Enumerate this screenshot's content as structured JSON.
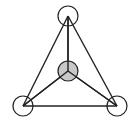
{
  "diagram": {
    "type": "tetrahedral-graph",
    "stroke_color": "#222222",
    "center_fill": "#c8c8c8",
    "outer_fill": "#ffffff",
    "nodes": [
      {
        "id": "top",
        "x": 68,
        "y": 16,
        "r": 10,
        "filled": false
      },
      {
        "id": "bottom-left",
        "x": 23,
        "y": 106,
        "r": 10,
        "filled": false
      },
      {
        "id": "bottom-right",
        "x": 117,
        "y": 106,
        "r": 10,
        "filled": false
      },
      {
        "id": "center",
        "x": 68,
        "y": 71,
        "r": 10,
        "filled": true
      }
    ],
    "edges": [
      [
        "top",
        "bottom-left"
      ],
      [
        "top",
        "bottom-right"
      ],
      [
        "bottom-left",
        "bottom-right"
      ],
      [
        "center",
        "top"
      ],
      [
        "center",
        "bottom-left"
      ],
      [
        "center",
        "bottom-right"
      ]
    ]
  }
}
